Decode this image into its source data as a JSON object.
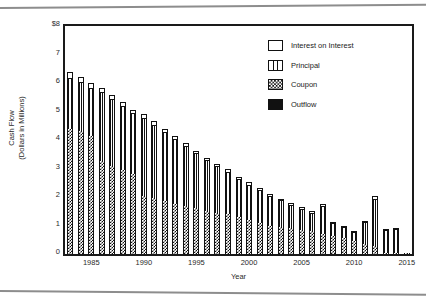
{
  "chart_data": {
    "type": "bar",
    "title": "",
    "xlabel": "Year",
    "ylabel": "Cash Flow (Dollars in Millions)",
    "ylabel_line1": "Cash Flow",
    "ylabel_line2": "(Dollars in Millions)",
    "stacked": true,
    "grid": false,
    "legend_position": "top-right",
    "ylim": [
      0,
      8
    ],
    "xlim": [
      1982.5,
      2015.5
    ],
    "y_ticks": [
      "0",
      "1",
      "2",
      "3",
      "4",
      "5",
      "6",
      "7",
      "$8"
    ],
    "y_tick_values": [
      0,
      1,
      2,
      3,
      4,
      5,
      6,
      7,
      8
    ],
    "x_ticks": [
      "1985",
      "1990",
      "1995",
      "2000",
      "2005",
      "2010",
      "2015"
    ],
    "x_tick_values": [
      1985,
      1990,
      1995,
      2000,
      2005,
      2010,
      2015
    ],
    "categories": [
      1983,
      1984,
      1985,
      1986,
      1987,
      1988,
      1989,
      1990,
      1991,
      1992,
      1993,
      1994,
      1995,
      1996,
      1997,
      1998,
      1999,
      2000,
      2001,
      2002,
      2003,
      2004,
      2005,
      2006,
      2007,
      2008,
      2009,
      2010,
      2011,
      2012,
      2013,
      2014,
      2015
    ],
    "series": [
      {
        "name": "Coupon",
        "values": [
          4.4,
          4.3,
          4.15,
          3.25,
          3.1,
          2.95,
          2.8,
          2.05,
          1.95,
          1.85,
          1.75,
          1.7,
          1.6,
          1.5,
          1.45,
          1.4,
          1.3,
          1.2,
          1.1,
          1.0,
          0.95,
          0.9,
          0.85,
          0.8,
          0.7,
          0.62,
          0.55,
          0.45,
          0.35,
          0.28,
          0.05,
          0.04,
          0.03
        ]
      },
      {
        "name": "Principal",
        "values": [
          1.75,
          1.7,
          1.65,
          2.4,
          2.3,
          2.2,
          2.1,
          2.7,
          2.55,
          2.4,
          2.25,
          2.05,
          1.9,
          1.75,
          1.6,
          1.45,
          1.3,
          1.2,
          1.1,
          1.0,
          0.9,
          0.8,
          0.7,
          0.62,
          0.95,
          0.42,
          0.35,
          0.28,
          0.75,
          1.62,
          0.75,
          0.8,
          0.0
        ]
      },
      {
        "name": "Interest on Interest",
        "values": [
          0.22,
          0.2,
          0.2,
          0.18,
          0.18,
          0.17,
          0.17,
          0.16,
          0.15,
          0.15,
          0.14,
          0.14,
          0.13,
          0.13,
          0.12,
          0.12,
          0.11,
          0.11,
          0.1,
          0.1,
          0.09,
          0.09,
          0.09,
          0.08,
          0.1,
          0.08,
          0.07,
          0.07,
          0.07,
          0.12,
          0.06,
          0.06,
          0.0
        ]
      },
      {
        "name": "Outflow",
        "values": [
          0,
          0,
          0,
          0,
          0,
          0,
          0,
          0,
          0,
          0,
          0,
          0,
          0,
          0,
          0,
          0,
          0,
          0,
          0,
          0,
          0,
          0,
          0,
          0,
          0,
          0,
          0,
          0,
          0,
          0,
          0,
          0,
          0
        ]
      }
    ],
    "totals": [
      6.37,
      6.2,
      6.0,
      5.83,
      5.58,
      5.32,
      5.07,
      4.91,
      4.65,
      4.4,
      4.14,
      3.89,
      3.63,
      3.38,
      3.17,
      2.97,
      2.71,
      2.51,
      2.3,
      2.1,
      1.94,
      1.79,
      1.64,
      1.5,
      1.75,
      1.12,
      0.97,
      0.8,
      1.17,
      2.02,
      0.86,
      0.9,
      0.03
    ]
  },
  "legend": {
    "items": [
      {
        "label": "Interest on Interest",
        "swatch": "interest-swatch-icon"
      },
      {
        "label": "Principal",
        "swatch": "principal-swatch-icon"
      },
      {
        "label": "Coupon",
        "swatch": "coupon-swatch-icon"
      },
      {
        "label": "Outflow",
        "swatch": "outflow-swatch-icon"
      }
    ]
  }
}
